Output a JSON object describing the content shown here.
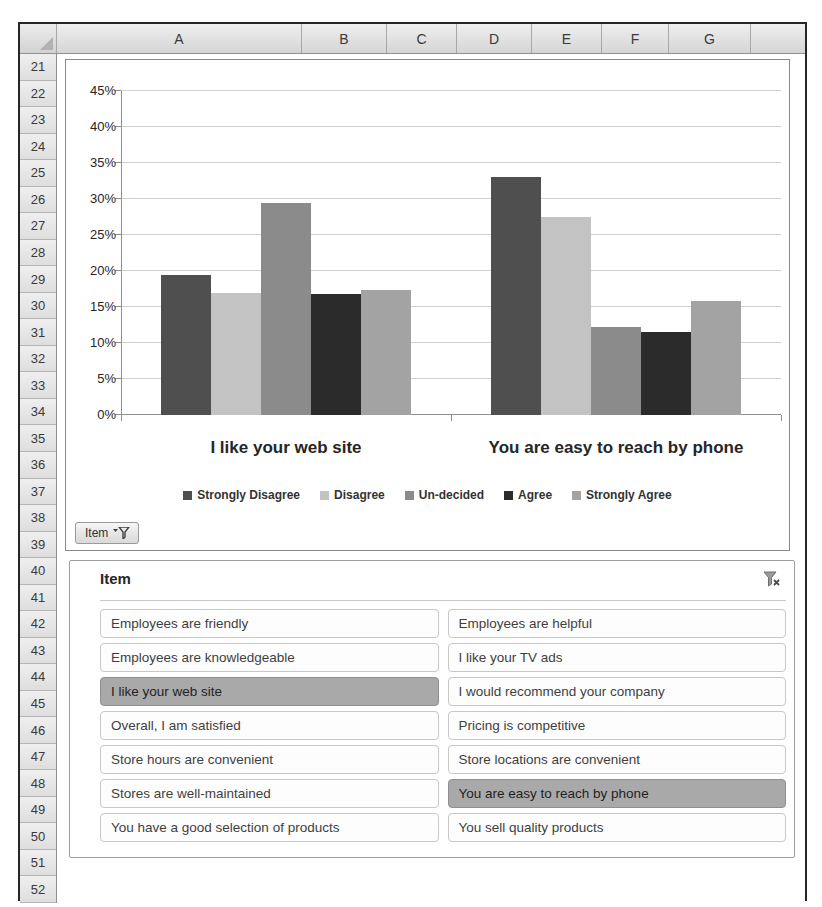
{
  "spreadsheet": {
    "columns": [
      "A",
      "B",
      "C",
      "D",
      "E",
      "F",
      "G"
    ],
    "rows": [
      "21",
      "22",
      "23",
      "24",
      "25",
      "26",
      "27",
      "28",
      "29",
      "30",
      "31",
      "32",
      "33",
      "34",
      "35",
      "36",
      "37",
      "38",
      "39",
      "40",
      "41",
      "42",
      "43",
      "44",
      "45",
      "46",
      "47",
      "48",
      "49",
      "50",
      "51",
      "52"
    ]
  },
  "chart": {
    "field_button_label": "Item"
  },
  "chart_data": {
    "type": "bar",
    "title": "",
    "categories": [
      "I like your web site",
      "You are easy to reach by phone"
    ],
    "series": [
      {
        "name": "Strongly Disagree",
        "color": "#4f4f4f",
        "values": [
          19.5,
          33.0
        ]
      },
      {
        "name": "Disagree",
        "color": "#c3c3c3",
        "values": [
          17.0,
          27.5
        ]
      },
      {
        "name": "Un-decided",
        "color": "#8b8b8b",
        "values": [
          29.5,
          12.2
        ]
      },
      {
        "name": "Agree",
        "color": "#2b2b2b",
        "values": [
          16.8,
          11.5
        ]
      },
      {
        "name": "Strongly Agree",
        "color": "#a3a3a3",
        "values": [
          17.3,
          15.8
        ]
      }
    ],
    "xlabel": "",
    "ylabel": "",
    "ylim": [
      0,
      45
    ],
    "ytick_step": 5,
    "ytick_labels": [
      "0%",
      "5%",
      "10%",
      "15%",
      "20%",
      "25%",
      "30%",
      "35%",
      "40%",
      "45%"
    ],
    "grid": true,
    "legend_position": "bottom"
  },
  "slicer": {
    "title": "Item",
    "items": [
      {
        "label": "Employees are friendly",
        "selected": false
      },
      {
        "label": "Employees are helpful",
        "selected": false
      },
      {
        "label": "Employees are knowledgeable",
        "selected": false
      },
      {
        "label": "I like your TV ads",
        "selected": false
      },
      {
        "label": "I like your web site",
        "selected": true
      },
      {
        "label": "I would recommend your company",
        "selected": false
      },
      {
        "label": "Overall, I am satisfied",
        "selected": false
      },
      {
        "label": "Pricing is competitive",
        "selected": false
      },
      {
        "label": "Store hours are convenient",
        "selected": false
      },
      {
        "label": "Store locations are convenient",
        "selected": false
      },
      {
        "label": "Stores are well-maintained",
        "selected": false
      },
      {
        "label": "You are easy to reach by phone",
        "selected": true
      },
      {
        "label": "You have a good selection of products",
        "selected": false
      },
      {
        "label": "You sell quality products",
        "selected": false
      }
    ]
  }
}
